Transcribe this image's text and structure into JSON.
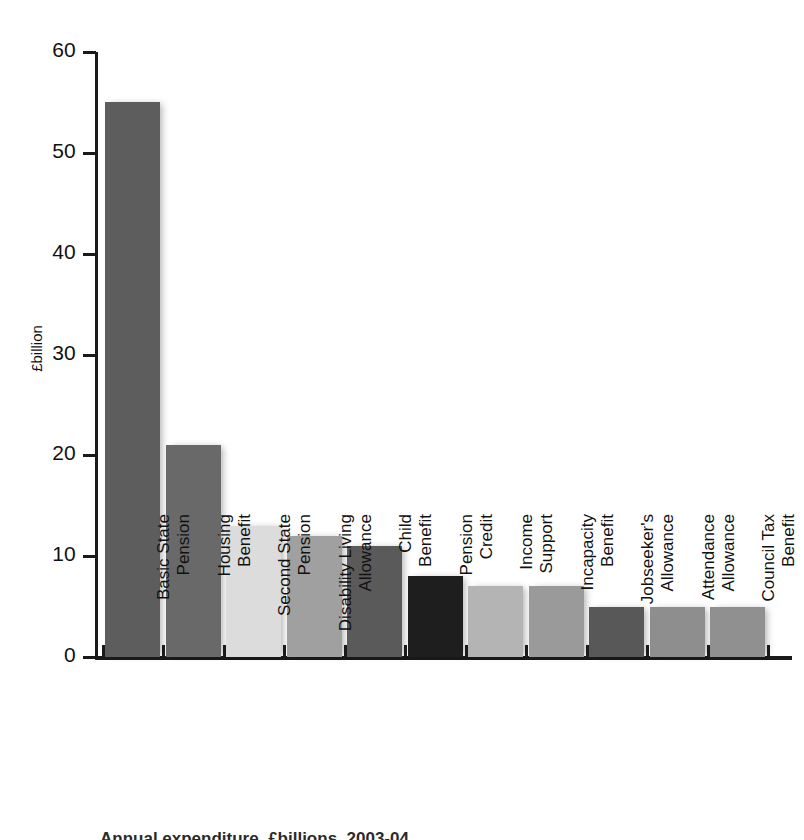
{
  "chart_data": {
    "type": "bar",
    "title": "",
    "xlabel": "",
    "ylabel": "£billion",
    "ylim": [
      0,
      60
    ],
    "yticks": [
      0,
      10,
      20,
      30,
      40,
      50,
      60
    ],
    "ytick_labels": [
      "0",
      "10",
      "20",
      "30",
      "40",
      "50",
      "60"
    ],
    "grid": false,
    "legend": "none",
    "categories": [
      "Basic State Pension",
      "Housing Benefit",
      "Second State Pension",
      "Disability Living Allowance",
      "Child Benefit",
      "Pension Credit",
      "Income Support",
      "Incapacity Benefit",
      "Jobseeker's Allowance",
      "Attendance Allowance",
      "Council Tax Benefit"
    ],
    "category_lines": [
      [
        "Basic State",
        "Pension"
      ],
      [
        "Housing",
        "Benefit"
      ],
      [
        "Second State",
        "Pension"
      ],
      [
        "Disability Living",
        "Allowance"
      ],
      [
        "Child",
        "Benefit"
      ],
      [
        "Pension",
        "Credit"
      ],
      [
        "Income",
        "Support"
      ],
      [
        "Incapacity",
        "Benefit"
      ],
      [
        "Jobseeker's",
        "Allowance"
      ],
      [
        "Attendance",
        "Allowance"
      ],
      [
        "Council Tax",
        "Benefit"
      ]
    ],
    "values": [
      55,
      21,
      13,
      12,
      11,
      8,
      7,
      7,
      5,
      5,
      5
    ],
    "bar_colors": [
      "#5d5d5d",
      "#696969",
      "#dcdcdc",
      "#a0a0a0",
      "#5a5a5a",
      "#1e1e1e",
      "#b4b4b4",
      "#9a9a9a",
      "#585858",
      "#8e8e8e",
      "#909090"
    ]
  },
  "axis": {
    "y_title": "£billion",
    "axis_color": "#1a1a1a"
  },
  "caption": {
    "text": "Annual expenditure, £billions, 2003-04"
  }
}
